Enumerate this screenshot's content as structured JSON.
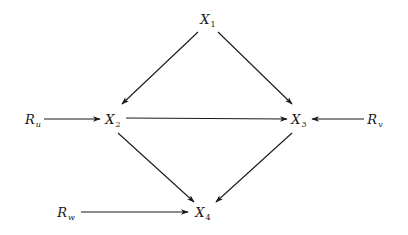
{
  "diagram": {
    "type": "directed-graph",
    "nodes": [
      {
        "id": "X1",
        "base": "X",
        "sub": "1",
        "x": 208,
        "y": 20
      },
      {
        "id": "X2",
        "base": "X",
        "sub": "2",
        "x": 113,
        "y": 120
      },
      {
        "id": "X3",
        "base": "X",
        "sub": "3",
        "x": 299,
        "y": 120
      },
      {
        "id": "X4",
        "base": "X",
        "sub": "4",
        "x": 203,
        "y": 213
      },
      {
        "id": "Ru",
        "base": "R",
        "sub": "u",
        "x": 33,
        "y": 120
      },
      {
        "id": "Rv",
        "base": "R",
        "sub": "v",
        "x": 375,
        "y": 120
      },
      {
        "id": "Rw",
        "base": "R",
        "sub": "w",
        "x": 66,
        "y": 213
      }
    ],
    "edges": [
      {
        "from": "X1",
        "to": "X2"
      },
      {
        "from": "X1",
        "to": "X3"
      },
      {
        "from": "X2",
        "to": "X3"
      },
      {
        "from": "X2",
        "to": "X4"
      },
      {
        "from": "X3",
        "to": "X4"
      },
      {
        "from": "Ru",
        "to": "X2"
      },
      {
        "from": "Rv",
        "to": "X3"
      },
      {
        "from": "Rw",
        "to": "X4"
      }
    ],
    "line_color": "#1a1a1a"
  }
}
